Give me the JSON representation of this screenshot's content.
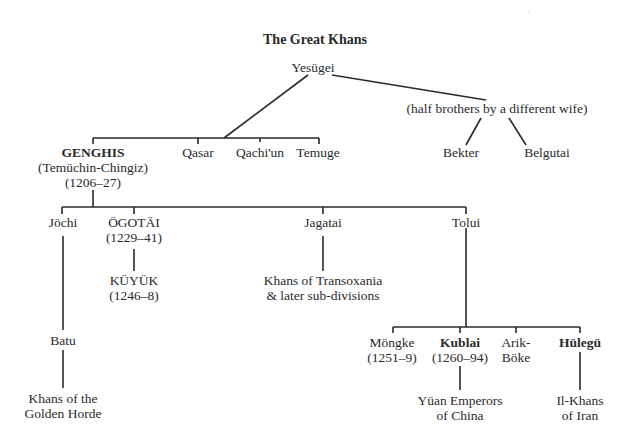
{
  "title": "The Great Khans",
  "colors": {
    "ink": "#2a2a2a",
    "background": "#ffffff"
  },
  "nodes": {
    "yesugei": {
      "name": "Yesügei"
    },
    "half_brothers": {
      "name": "(half brothers by a different wife)"
    },
    "genghis": {
      "name": "GENGHIS",
      "alt": "(Temüchin-Chingiz)",
      "reign": "(1206–27)"
    },
    "qasar": {
      "name": "Qasar"
    },
    "qachiun": {
      "name": "Qachi'un"
    },
    "temuge": {
      "name": "Temuge"
    },
    "bekter": {
      "name": "Bekter"
    },
    "belgutai": {
      "name": "Belgutai"
    },
    "jochi": {
      "name": "Jöchi"
    },
    "ogotai": {
      "name": "ÖGOTÄI",
      "reign": "(1229–41)"
    },
    "jagatai": {
      "name": "Jagatai"
    },
    "tolui": {
      "name": "Tolui"
    },
    "kuyuk": {
      "name": "KÜYÜK",
      "reign": "(1246–8)"
    },
    "transoxania": {
      "line1": "Khans of Transoxania",
      "line2": "& later sub-divisions"
    },
    "batu": {
      "name": "Batu"
    },
    "golden_horde": {
      "line1": "Khans of the",
      "line2": "Golden Horde"
    },
    "mongke": {
      "name": "Möngke",
      "reign": "(1251–9)"
    },
    "kublai": {
      "name": "Kublai",
      "reign": "(1260–94)"
    },
    "arik_boke": {
      "line1": "Arik-",
      "line2": "Böke"
    },
    "hulegu": {
      "name": "Hülegü"
    },
    "yuan": {
      "line1": "Yüan Emperors",
      "line2": "of China"
    },
    "il_khans": {
      "line1": "Il-Khans",
      "line2": "of Iran"
    }
  },
  "relationships": [
    {
      "parent": "Yesügei",
      "children": [
        "GENGHIS",
        "Qasar",
        "Qachi'un",
        "Temuge"
      ]
    },
    {
      "parent": "Yesügei",
      "via": "(half brothers by a different wife)",
      "children": [
        "Bekter",
        "Belgutai"
      ]
    },
    {
      "parent": "GENGHIS",
      "children": [
        "Jöchi",
        "ÖGOTÄI",
        "Jagatai",
        "Tolui"
      ]
    },
    {
      "parent": "ÖGOTÄI",
      "children": [
        "KÜYÜK"
      ]
    },
    {
      "parent": "Jagatai",
      "children": [
        "Khans of Transoxania & later sub-divisions"
      ]
    },
    {
      "parent": "Jöchi",
      "children": [
        "Batu"
      ]
    },
    {
      "parent": "Batu",
      "children": [
        "Khans of the Golden Horde"
      ]
    },
    {
      "parent": "Tolui",
      "children": [
        "Möngke",
        "Kublai",
        "Arik-Böke",
        "Hülegü"
      ]
    },
    {
      "parent": "Kublai",
      "children": [
        "Yüan Emperors of China"
      ]
    },
    {
      "parent": "Hülegü",
      "children": [
        "Il-Khans of Iran"
      ]
    }
  ]
}
